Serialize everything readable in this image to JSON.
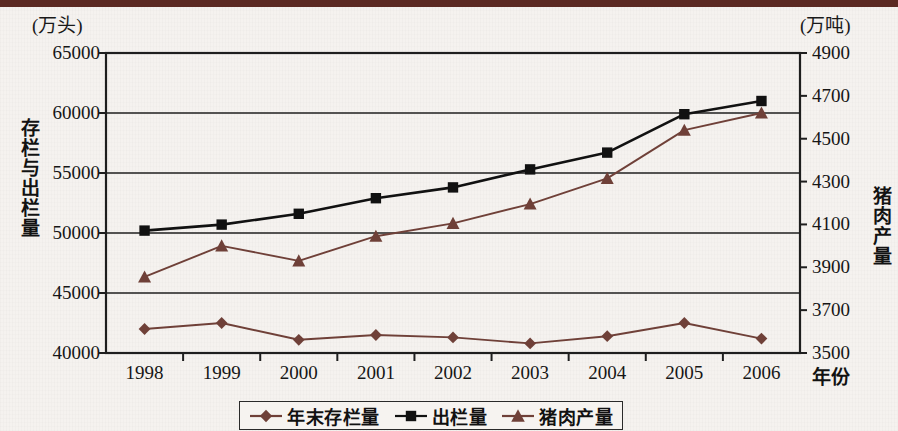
{
  "axes": {
    "left_unit": "(万头)",
    "right_unit": "(万吨)",
    "left_title": "存栏与出栏量",
    "right_title": "猪肉产量",
    "x_title": "年份"
  },
  "colors": {
    "brown": "#6f4038",
    "black": "#111111",
    "topband": "#5c2a23",
    "paper": "#f5f2ef",
    "axis": "#1e1e1e"
  },
  "chart_data": {
    "type": "line",
    "title": "",
    "xlabel": "年份",
    "ylabel": "存栏与出栏量",
    "y2label": "猪肉产量",
    "grid": true,
    "legend_position": "bottom",
    "categories": [
      "1998",
      "1999",
      "2000",
      "2001",
      "2002",
      "2003",
      "2004",
      "2005",
      "2006"
    ],
    "ylim": [
      40000,
      65000
    ],
    "yticks": [
      "65000",
      "60000",
      "55000",
      "50000",
      "45000",
      "40000"
    ],
    "ytick_values": [
      65000,
      60000,
      55000,
      50000,
      45000,
      40000
    ],
    "y2lim": [
      3500,
      4900
    ],
    "y2ticks": [
      "4900",
      "4700",
      "4500",
      "4300",
      "4100",
      "3900",
      "3700",
      "3500"
    ],
    "y2tick_values": [
      4900,
      4700,
      4500,
      4300,
      4100,
      3900,
      3700,
      3500
    ],
    "series": [
      {
        "name": "年末存栏量",
        "axis": "left",
        "marker": "diamond",
        "color": "#6f4038",
        "values": [
          42000,
          42500,
          41100,
          41500,
          41300,
          40800,
          41400,
          42500,
          41200
        ]
      },
      {
        "name": "出栏量",
        "axis": "left",
        "marker": "square",
        "color": "#111111",
        "values": [
          50200,
          50700,
          51600,
          52900,
          53800,
          55300,
          56700,
          59900,
          61000
        ]
      },
      {
        "name": "猪肉产量",
        "axis": "right",
        "marker": "triangle",
        "color": "#6f4038",
        "values": [
          3855,
          4000,
          3930,
          4045,
          4105,
          4195,
          4315,
          4540,
          4620
        ]
      }
    ]
  }
}
